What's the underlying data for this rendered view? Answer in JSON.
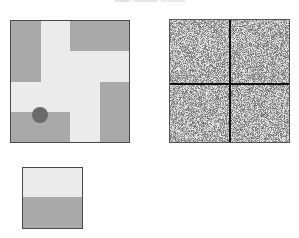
{
  "title": {
    "text": "",
    "clipped": true
  },
  "colors": {
    "floor": "#ebebeb",
    "wall": "#a9a9a9",
    "agent": "#6b6b6b",
    "border": "#4a4a4a",
    "divider": "#111111"
  },
  "maze": {
    "grid_size": 4,
    "walls": [
      {
        "name": "wall-top-left",
        "col": 0,
        "row": 0,
        "cols": 1,
        "rows": 2
      },
      {
        "name": "wall-top-right",
        "col": 2,
        "row": 0,
        "cols": 2,
        "rows": 1
      },
      {
        "name": "wall-right",
        "col": 3,
        "row": 2,
        "cols": 1,
        "rows": 2
      },
      {
        "name": "wall-bottom-left",
        "col": 0,
        "row": 3,
        "cols": 2,
        "rows": 1
      }
    ],
    "agent": {
      "x": 29,
      "y": 94,
      "radius": 8
    }
  },
  "observation": {
    "quadrants": 4,
    "type": "noise"
  },
  "goal_preview": {
    "top": "floor",
    "bottom": "wall"
  }
}
